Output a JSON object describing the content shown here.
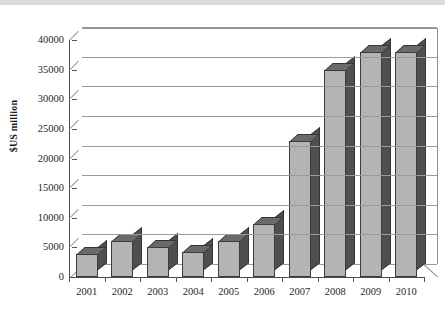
{
  "chart_data": {
    "type": "bar",
    "title": "",
    "subtitle": "",
    "xlabel": "",
    "ylabel": "$US million",
    "categories": [
      "2001",
      "2002",
      "2003",
      "2004",
      "2005",
      "2006",
      "2007",
      "2008",
      "2009",
      "2010"
    ],
    "values": [
      3800,
      6100,
      5000,
      4300,
      6000,
      9000,
      23000,
      35000,
      38000,
      38000
    ],
    "series": [
      {
        "name": "$US million",
        "values": [
          3800,
          6100,
          5000,
          4300,
          6000,
          9000,
          23000,
          35000,
          38000,
          38000
        ]
      }
    ],
    "ylim": [
      0,
      40000
    ],
    "ytick_values": [
      0,
      5000,
      10000,
      15000,
      20000,
      25000,
      30000,
      35000,
      40000
    ],
    "ytick_labels": [
      "0",
      "5000",
      "10000",
      "15000",
      "20000",
      "25000",
      "30000",
      "35000",
      "40000"
    ],
    "xtick_labels": [
      "2001",
      "2002",
      "2003",
      "2004",
      "2005",
      "2006",
      "2007",
      "2008",
      "2009",
      "2010"
    ],
    "grid": "horizontal",
    "legend": "none",
    "style": "3d-column",
    "colors": {
      "bar_face": "#b4b4b4",
      "bar_side": "#4f4f4f",
      "bar_top": "#6a6a6a",
      "bar_outline": "#3c3c3c",
      "gridline": "#9a9a9a",
      "axis": "#4a4a4a",
      "text": "#1f1f1f",
      "background": "#ffffff"
    }
  }
}
